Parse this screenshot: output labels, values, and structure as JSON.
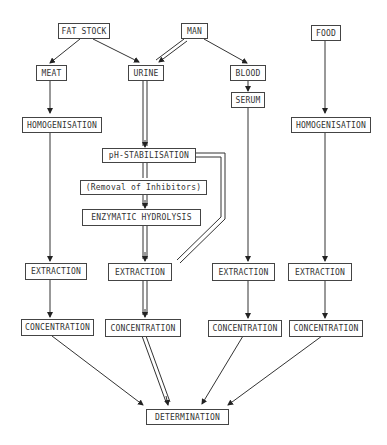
{
  "diagram": {
    "nodes": {
      "fat_stock": "FAT STOCK",
      "man": "MAN",
      "food": "FOOD",
      "meat": "MEAT",
      "urine": "URINE",
      "blood": "BLOOD",
      "serum": "SERUM",
      "homogenisation_meat": "HOMOGENISATION",
      "homogenisation_food": "HOMOGENISATION",
      "ph_stabilisation": "pH-STABILISATION",
      "removal_inhibitors": "(Removal of Inhibitors)",
      "enzymatic_hydrolysis": "ENZYMATIC HYDROLYSIS",
      "extraction_meat": "EXTRACTION",
      "extraction_urine": "EXTRACTION",
      "extraction_serum": "EXTRACTION",
      "extraction_food": "EXTRACTION",
      "concentration_meat": "CONCENTRATION",
      "concentration_urine": "CONCENTRATION",
      "concentration_serum": "CONCENTRATION",
      "concentration_food": "CONCENTRATION",
      "determination": "DETERMINATION"
    },
    "edges": [
      [
        "FAT STOCK",
        "MEAT"
      ],
      [
        "FAT STOCK",
        "URINE"
      ],
      [
        "MAN",
        "URINE (double)"
      ],
      [
        "MAN",
        "BLOOD"
      ],
      [
        "BLOOD",
        "SERUM"
      ],
      [
        "MEAT",
        "HOMOGENISATION"
      ],
      [
        "URINE",
        "pH-STABILISATION (double)"
      ],
      [
        "pH-STABILISATION",
        "(Removal of Inhibitors) (double)"
      ],
      [
        "(Removal of Inhibitors)",
        "ENZYMATIC HYDROLYSIS (double)"
      ],
      [
        "ENZYMATIC HYDROLYSIS",
        "EXTRACTION (double)"
      ],
      [
        "pH-STABILISATION",
        "EXTRACTION (double bypass)"
      ],
      [
        "HOMOGENISATION",
        "EXTRACTION"
      ],
      [
        "SERUM",
        "EXTRACTION"
      ],
      [
        "FOOD",
        "HOMOGENISATION"
      ],
      [
        "HOMOGENISATION",
        "EXTRACTION"
      ],
      [
        "EXTRACTION",
        "CONCENTRATION"
      ],
      [
        "CONCENTRATION",
        "DETERMINATION"
      ]
    ]
  }
}
